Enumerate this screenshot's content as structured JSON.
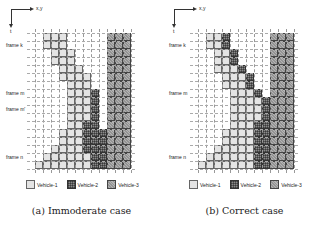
{
  "axis": {
    "x_label": "x,y",
    "t_label": "t"
  },
  "grid": {
    "cols": 12,
    "rows": 17,
    "cell_px": 8
  },
  "legend": [
    {
      "key": "v1",
      "label": "Vehicle-1"
    },
    {
      "key": "v2",
      "label": "Vehicle-2"
    },
    {
      "key": "v3",
      "label": "Vehicle-3"
    }
  ],
  "panels": [
    {
      "id": "a",
      "caption": "(a) Immoderate case",
      "frame_labels": [
        {
          "label": "frame k",
          "row": 1
        },
        {
          "label": "frame m",
          "row": 7
        },
        {
          "label": "frame m'",
          "row": 9
        },
        {
          "label": "frame n",
          "row": 15
        }
      ],
      "occupancy": {
        "v1": [
          [
            1,
            4
          ],
          [
            1,
            4
          ],
          [
            2,
            5
          ],
          [
            2,
            5
          ],
          [
            3,
            6
          ],
          [
            3,
            7
          ],
          [
            4,
            7
          ],
          [
            4,
            8
          ],
          [
            4,
            8
          ],
          [
            4,
            8
          ],
          [
            4,
            8
          ],
          [
            4,
            8
          ],
          [
            3,
            8
          ],
          [
            3,
            8
          ],
          [
            2,
            8
          ],
          [
            1,
            7
          ],
          [
            0,
            7
          ]
        ],
        "v2": [
          null,
          null,
          null,
          null,
          null,
          null,
          null,
          [
            7,
            8
          ],
          [
            7,
            8
          ],
          [
            7,
            8
          ],
          [
            7,
            8
          ],
          [
            6,
            8
          ],
          [
            6,
            9
          ],
          [
            6,
            9
          ],
          [
            6,
            9
          ],
          [
            7,
            9
          ],
          [
            7,
            9
          ]
        ],
        "v3": [
          [
            9,
            12
          ],
          [
            9,
            12
          ],
          [
            9,
            12
          ],
          [
            9,
            12
          ],
          [
            9,
            12
          ],
          [
            9,
            12
          ],
          [
            9,
            12
          ],
          [
            9,
            12
          ],
          [
            9,
            12
          ],
          [
            9,
            12
          ],
          [
            9,
            12
          ],
          [
            9,
            12
          ],
          [
            9,
            12
          ],
          [
            9,
            12
          ],
          [
            9,
            12
          ],
          [
            9,
            12
          ],
          [
            9,
            12
          ]
        ]
      }
    },
    {
      "id": "b",
      "caption": "(b) Correct case",
      "frame_labels": [
        {
          "label": "frame k",
          "row": 1
        },
        {
          "label": "frame m",
          "row": 7
        },
        {
          "label": "frame n",
          "row": 15
        }
      ],
      "occupancy": {
        "v1": [
          [
            1,
            3
          ],
          [
            1,
            3
          ],
          [
            2,
            4
          ],
          [
            2,
            4
          ],
          [
            2,
            5
          ],
          [
            3,
            6
          ],
          [
            3,
            6
          ],
          [
            4,
            7
          ],
          [
            4,
            8
          ],
          [
            4,
            8
          ],
          [
            4,
            8
          ],
          [
            4,
            8
          ],
          [
            3,
            8
          ],
          [
            3,
            8
          ],
          [
            2,
            8
          ],
          [
            1,
            7
          ],
          [
            0,
            7
          ]
        ],
        "v2": [
          [
            3,
            4
          ],
          [
            3,
            4
          ],
          [
            4,
            5
          ],
          [
            4,
            5
          ],
          [
            5,
            6
          ],
          [
            6,
            7
          ],
          [
            6,
            7
          ],
          [
            7,
            8
          ],
          [
            8,
            9
          ],
          [
            8,
            9
          ],
          [
            8,
            9
          ],
          [
            7,
            9
          ],
          [
            7,
            9
          ],
          [
            7,
            9
          ],
          [
            7,
            9
          ],
          [
            7,
            9
          ],
          [
            7,
            9
          ]
        ],
        "v3": [
          [
            9,
            12
          ],
          [
            9,
            12
          ],
          [
            9,
            12
          ],
          [
            9,
            12
          ],
          [
            9,
            12
          ],
          [
            9,
            12
          ],
          [
            9,
            12
          ],
          [
            9,
            12
          ],
          [
            9,
            12
          ],
          [
            9,
            12
          ],
          [
            9,
            12
          ],
          [
            9,
            12
          ],
          [
            9,
            12
          ],
          [
            9,
            12
          ],
          [
            9,
            12
          ],
          [
            9,
            12
          ],
          [
            9,
            12
          ]
        ]
      }
    }
  ]
}
